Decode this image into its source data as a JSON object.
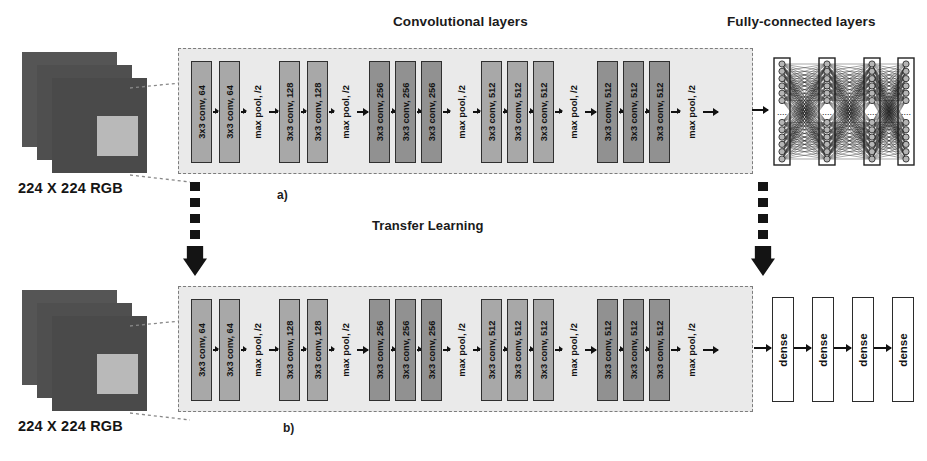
{
  "figure": {
    "headings": {
      "convolutional": "Convolutional layers",
      "fully_connected": "Fully-connected layers",
      "transfer": "Transfer Learning"
    },
    "panel_labels": {
      "a": "a)",
      "b": "b)"
    },
    "input": {
      "caption": "224 X 224 RGB",
      "sheets": 3,
      "sheet_color": "#4f4f4f",
      "patch_color": "#b9b9b9"
    },
    "colors": {
      "panel_fill": "#eaeaea",
      "panel_border": "#7d7d7d",
      "conv_block_fill": "#a8a8a8",
      "conv_block_fill_dark": "#919191",
      "block_border": "#2f2f2f",
      "dense_fill": "#ffffff",
      "arrow": "#111111"
    },
    "vgg_layers": [
      {
        "kind": "conv",
        "label": "3x3 conv, 64",
        "shade": "light"
      },
      {
        "kind": "conv",
        "label": "3x3 conv, 64",
        "shade": "light"
      },
      {
        "kind": "pool",
        "label": "max pool, /2"
      },
      {
        "kind": "conv",
        "label": "3x3 conv, 128",
        "shade": "light"
      },
      {
        "kind": "conv",
        "label": "3x3 conv, 128",
        "shade": "light"
      },
      {
        "kind": "pool",
        "label": "max pool, /2"
      },
      {
        "kind": "conv",
        "label": "3x3 conv, 256",
        "shade": "dark"
      },
      {
        "kind": "conv",
        "label": "3x3 conv, 256",
        "shade": "dark"
      },
      {
        "kind": "conv",
        "label": "3x3 conv, 256",
        "shade": "dark"
      },
      {
        "kind": "pool",
        "label": "max pool, /2"
      },
      {
        "kind": "conv",
        "label": "3x3 conv, 512",
        "shade": "light"
      },
      {
        "kind": "conv",
        "label": "3x3 conv, 512",
        "shade": "light"
      },
      {
        "kind": "conv",
        "label": "3x3 conv, 512",
        "shade": "light"
      },
      {
        "kind": "pool",
        "label": "max pool, /2"
      },
      {
        "kind": "conv",
        "label": "3x3 conv, 512",
        "shade": "dark"
      },
      {
        "kind": "conv",
        "label": "3x3 conv, 512",
        "shade": "dark"
      },
      {
        "kind": "conv",
        "label": "3x3 conv, 512",
        "shade": "dark"
      },
      {
        "kind": "pool",
        "label": "max pool, /2"
      }
    ],
    "dense_layers": [
      {
        "label": "dense"
      },
      {
        "label": "dense"
      },
      {
        "label": "dense"
      },
      {
        "label": "dense"
      }
    ],
    "fc_cloud": {
      "columns": 4,
      "nodes_per_column": 14,
      "ellipsis": "...."
    }
  }
}
